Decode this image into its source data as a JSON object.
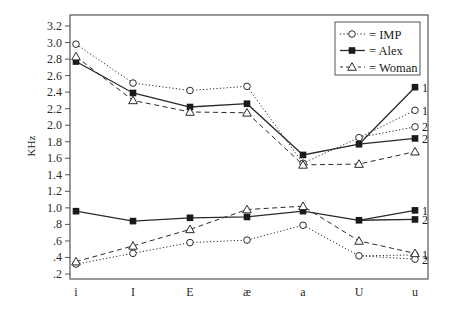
{
  "chart_data": {
    "type": "line",
    "title": "",
    "xlabel": "",
    "ylabel": "KHz",
    "ylim": [
      0.2,
      3.2
    ],
    "yticks": [
      "3.2",
      "3.0",
      "2.8",
      "2.6",
      "2.4",
      "2.2",
      "2.0",
      "1.8",
      "1.6",
      "1.4",
      "1.2",
      "1.0",
      ".8",
      ".6",
      ".4",
      ".2"
    ],
    "categories": [
      "i",
      "I",
      "E",
      "æ",
      "a",
      "U",
      "u"
    ],
    "legend": {
      "position": "upper right",
      "entries": [
        {
          "marker": "open-circle",
          "line": "dotted",
          "label": "= IMP"
        },
        {
          "marker": "filled-square",
          "line": "solid",
          "label": "= Alex"
        },
        {
          "marker": "open-triangle",
          "line": "dashed",
          "label": "= Woman"
        }
      ]
    },
    "series": [
      {
        "name": "IMP F2",
        "formant": "upper",
        "style": "dotted",
        "marker": "open-circle",
        "values": [
          2.98,
          2.51,
          2.42,
          2.47,
          1.54,
          1.85,
          null
        ],
        "u_branches": [
          {
            "label": "1",
            "value": 2.18
          },
          {
            "label": "2",
            "value": 1.98
          }
        ]
      },
      {
        "name": "Alex F2",
        "formant": "upper",
        "style": "solid",
        "marker": "filled-square",
        "values": [
          2.77,
          2.39,
          2.22,
          2.26,
          1.64,
          1.77,
          null
        ],
        "u_branches": [
          {
            "label": "1",
            "value": 2.46
          },
          {
            "label": "2",
            "value": 1.84
          }
        ]
      },
      {
        "name": "Woman F2",
        "formant": "upper",
        "style": "dashed",
        "marker": "open-triangle",
        "values": [
          2.83,
          2.3,
          2.16,
          2.15,
          1.52,
          1.53,
          1.68
        ]
      },
      {
        "name": "IMP F1",
        "formant": "lower",
        "style": "dotted",
        "marker": "open-circle",
        "values": [
          0.32,
          0.45,
          0.58,
          0.61,
          0.79,
          0.42,
          null
        ],
        "u_branches": [
          {
            "label": "1",
            "value": 0.43
          },
          {
            "label": "2",
            "value": 0.38
          }
        ]
      },
      {
        "name": "Alex F1",
        "formant": "lower",
        "style": "solid",
        "marker": "filled-square",
        "values": [
          0.96,
          0.84,
          0.88,
          0.89,
          0.96,
          0.85,
          null
        ],
        "u_branches": [
          {
            "label": "1",
            "value": 0.97
          },
          {
            "label": "2",
            "value": 0.86
          }
        ]
      },
      {
        "name": "Woman F1",
        "formant": "lower",
        "style": "dashed",
        "marker": "open-triangle",
        "values": [
          0.35,
          0.54,
          0.74,
          0.98,
          1.02,
          0.6,
          0.45
        ]
      }
    ],
    "grid": false
  }
}
